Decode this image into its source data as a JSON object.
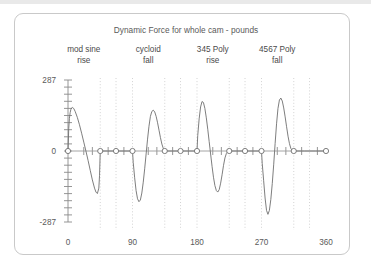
{
  "window": {
    "background_color": "#ffffff",
    "band_color": "#e9e9e9",
    "card_border_color": "#c9c9c9"
  },
  "chart_data": {
    "type": "line",
    "title": "Dynamic Force for whole cam - pounds",
    "xlabel": "",
    "ylabel": "",
    "xlim": [
      0,
      360
    ],
    "ylim": [
      -287,
      287
    ],
    "grid": true,
    "legend_position": "none",
    "x_ticks": [
      0,
      90,
      180,
      270,
      360
    ],
    "x_tick_labels": [
      "0",
      "90",
      "180",
      "270",
      "360"
    ],
    "y_ticks": [
      -287,
      0,
      287
    ],
    "y_tick_labels": [
      "-287",
      "0",
      "287"
    ],
    "y_minor_tick_count": 20,
    "line_color": "#6f6f6f",
    "marker_shape": "open-circle",
    "annotations": [
      {
        "line1": "mod sine",
        "line2": "rise",
        "x": 22
      },
      {
        "line1": "cycloid",
        "line2": "fall",
        "x": 112
      },
      {
        "line1": "345 Poly",
        "line2": "rise",
        "x": 202
      },
      {
        "line1": "4567 Poly",
        "line2": "fall",
        "x": 292
      }
    ],
    "gridline_x": [
      45,
      67,
      90,
      135,
      157,
      180,
      225,
      247,
      270,
      315,
      337
    ],
    "marker_points_x": [
      0,
      45,
      67,
      90,
      135,
      157,
      180,
      225,
      247,
      270,
      315,
      360
    ],
    "series": [
      {
        "name": "Dynamic Force",
        "points": [
          [
            0,
            0
          ],
          [
            1,
            90
          ],
          [
            2,
            132
          ],
          [
            3,
            155
          ],
          [
            4,
            168
          ],
          [
            5,
            174
          ],
          [
            6,
            176
          ],
          [
            8,
            172
          ],
          [
            10,
            160
          ],
          [
            13,
            136
          ],
          [
            16,
            106
          ],
          [
            19,
            72
          ],
          [
            22,
            36
          ],
          [
            25,
            0
          ],
          [
            28,
            -38
          ],
          [
            31,
            -78
          ],
          [
            34,
            -117
          ],
          [
            37,
            -150
          ],
          [
            39,
            -166
          ],
          [
            41,
            -172
          ],
          [
            43,
            -150
          ],
          [
            44,
            -100
          ],
          [
            45,
            0
          ],
          [
            46,
            0
          ],
          [
            55,
            0
          ],
          [
            67,
            0
          ],
          [
            78,
            0
          ],
          [
            90,
            0
          ],
          [
            91,
            -46
          ],
          [
            93,
            -108
          ],
          [
            95,
            -160
          ],
          [
            97,
            -193
          ],
          [
            99,
            -205
          ],
          [
            101,
            -198
          ],
          [
            103,
            -170
          ],
          [
            105,
            -126
          ],
          [
            107,
            -72
          ],
          [
            109,
            -12
          ],
          [
            111,
            48
          ],
          [
            113,
            100
          ],
          [
            115,
            140
          ],
          [
            117,
            160
          ],
          [
            119,
            165
          ],
          [
            121,
            158
          ],
          [
            123,
            140
          ],
          [
            125,
            114
          ],
          [
            127,
            84
          ],
          [
            129,
            54
          ],
          [
            131,
            28
          ],
          [
            133,
            10
          ],
          [
            135,
            0
          ],
          [
            136,
            0
          ],
          [
            145,
            0
          ],
          [
            157,
            0
          ],
          [
            168,
            0
          ],
          [
            180,
            0
          ],
          [
            181,
            62
          ],
          [
            183,
            130
          ],
          [
            185,
            178
          ],
          [
            187,
            200
          ],
          [
            189,
            196
          ],
          [
            191,
            172
          ],
          [
            193,
            134
          ],
          [
            195,
            88
          ],
          [
            197,
            38
          ],
          [
            199,
            -12
          ],
          [
            201,
            -62
          ],
          [
            203,
            -106
          ],
          [
            205,
            -140
          ],
          [
            207,
            -160
          ],
          [
            209,
            -166
          ],
          [
            211,
            -156
          ],
          [
            213,
            -130
          ],
          [
            215,
            -96
          ],
          [
            217,
            -58
          ],
          [
            219,
            -28
          ],
          [
            221,
            -10
          ],
          [
            223,
            -2
          ],
          [
            225,
            0
          ],
          [
            226,
            0
          ],
          [
            235,
            0
          ],
          [
            247,
            0
          ],
          [
            258,
            0
          ],
          [
            270,
            0
          ],
          [
            271,
            -50
          ],
          [
            273,
            -120
          ],
          [
            275,
            -190
          ],
          [
            277,
            -240
          ],
          [
            279,
            -256
          ],
          [
            281,
            -240
          ],
          [
            283,
            -196
          ],
          [
            285,
            -132
          ],
          [
            287,
            -56
          ],
          [
            289,
            30
          ],
          [
            291,
            110
          ],
          [
            293,
            172
          ],
          [
            295,
            206
          ],
          [
            297,
            214
          ],
          [
            299,
            202
          ],
          [
            301,
            174
          ],
          [
            303,
            138
          ],
          [
            305,
            98
          ],
          [
            307,
            60
          ],
          [
            309,
            30
          ],
          [
            311,
            10
          ],
          [
            313,
            2
          ],
          [
            315,
            0
          ],
          [
            316,
            0
          ],
          [
            330,
            0
          ],
          [
            345,
            0
          ],
          [
            360,
            0
          ]
        ]
      }
    ]
  }
}
